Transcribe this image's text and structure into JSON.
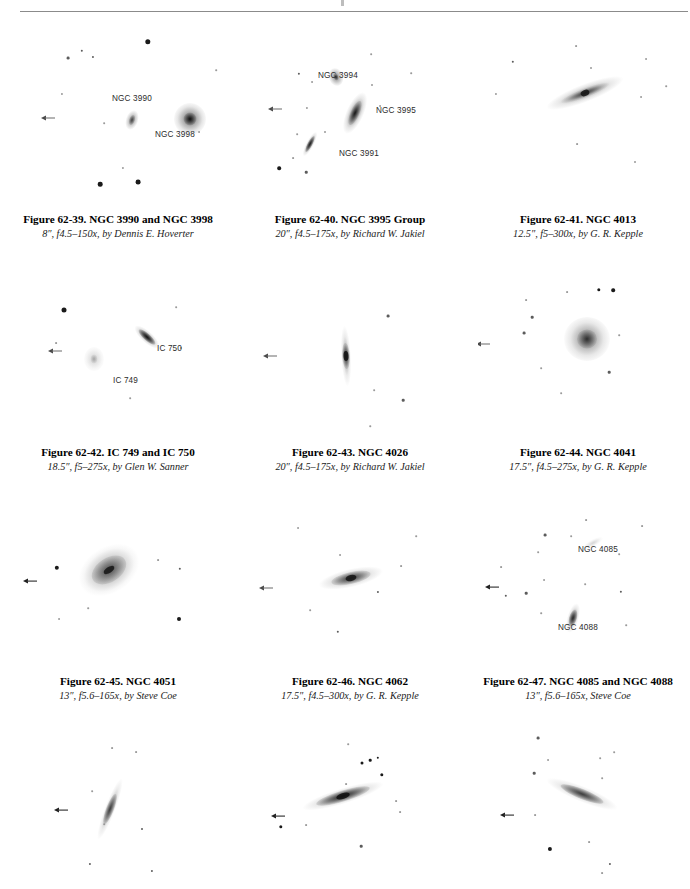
{
  "page": {
    "header_rule": true,
    "background": "#ffffff",
    "text_color": "#111111",
    "label_color": "#2b2b2b"
  },
  "plates": [
    {
      "id": "fig-62-39",
      "caption_title": "Figure 62-39. NGC 3990 and NGC 3998",
      "caption_sub": "8″, f4.5–150x, by Dennis E. Hoverter",
      "labels": [
        {
          "text": "NGC 3990",
          "x": 112,
          "y": 94
        },
        {
          "text": "NGC 3998",
          "x": 155,
          "y": 130
        }
      ],
      "objects": [
        "NGC 3990",
        "NGC 3998"
      ]
    },
    {
      "id": "fig-62-40",
      "caption_title": "Figure 62-40. NGC 3995 Group",
      "caption_sub": "20″, f4.5–175x, by Richard W. Jakiel",
      "labels": [
        {
          "text": "NGC 3994",
          "x": 318,
          "y": 71
        },
        {
          "text": "NGC 3995",
          "x": 376,
          "y": 106
        },
        {
          "text": "NGC 3991",
          "x": 339,
          "y": 149
        }
      ],
      "objects": [
        "NGC 3994",
        "NGC 3995",
        "NGC 3991"
      ]
    },
    {
      "id": "fig-62-41",
      "caption_title": "Figure 62-41. NGC 4013",
      "caption_sub": "12.5″, f5–300x, by G. R. Kepple",
      "labels": [],
      "objects": [
        "NGC 4013"
      ]
    },
    {
      "id": "fig-62-42",
      "caption_title": "Figure 62-42. IC 749 and IC 750",
      "caption_sub": "18.5″, f5–275x, by Glen W. Sanner",
      "labels": [
        {
          "text": "IC 750",
          "x": 157,
          "y": 344
        },
        {
          "text": "IC 749",
          "x": 113,
          "y": 376
        }
      ],
      "objects": [
        "IC 749",
        "IC 750"
      ]
    },
    {
      "id": "fig-62-43",
      "caption_title": "Figure 62-43. NGC 4026",
      "caption_sub": "20″, f4.5–175x, by Richard W. Jakiel",
      "labels": [],
      "objects": [
        "NGC 4026"
      ]
    },
    {
      "id": "fig-62-44",
      "caption_title": "Figure 62-44. NGC 4041",
      "caption_sub": "17.5″, f4.5–275x, by G. R. Kepple",
      "labels": [],
      "objects": [
        "NGC 4041"
      ]
    },
    {
      "id": "fig-62-45",
      "caption_title": "Figure 62-45. NGC 4051",
      "caption_sub": "13″, f5.6–165x, by Steve Coe",
      "labels": [],
      "objects": [
        "NGC 4051"
      ]
    },
    {
      "id": "fig-62-46",
      "caption_title": "Figure 62-46. NGC 4062",
      "caption_sub": "17.5″, f4.5–300x, by G. R. Kepple",
      "labels": [],
      "objects": [
        "NGC 4062"
      ]
    },
    {
      "id": "fig-62-47",
      "caption_title": "Figure 62-47. NGC 4085 and NGC 4088",
      "caption_sub": "13″, f5.6–165x, Steve Coe",
      "labels": [
        {
          "text": "NGC 4085",
          "x": 596,
          "y": 547
        },
        {
          "text": "NGC 4088",
          "x": 580,
          "y": 627
        }
      ],
      "objects": [
        "NGC 4085",
        "NGC 4088"
      ]
    },
    {
      "id": "fig-62-48",
      "caption_title": "",
      "caption_sub": "",
      "labels": [],
      "objects": []
    },
    {
      "id": "fig-62-49",
      "caption_title": "",
      "caption_sub": "",
      "labels": [],
      "objects": []
    },
    {
      "id": "fig-62-50",
      "caption_title": "",
      "caption_sub": "",
      "labels": [],
      "objects": []
    }
  ]
}
